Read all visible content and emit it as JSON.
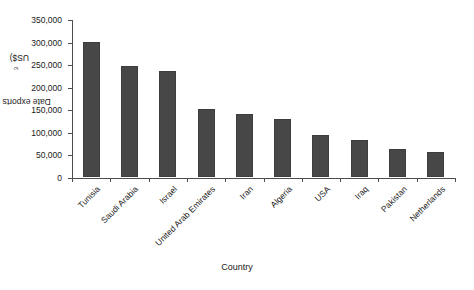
{
  "chart_data": {
    "type": "bar",
    "title": "",
    "xlabel": "Country",
    "ylabel": "Date exports (10³ US$)",
    "ylabel_prefix": "Date exports (10",
    "ylabel_exponent": "3",
    "ylabel_suffix": " US$)",
    "categories": [
      "Tunisia",
      "Saudi Arabia",
      "Israel",
      "United Arab Emirates",
      "Iran",
      "Algeria",
      "USA",
      "Iraq",
      "Pakistan",
      "Netherlands"
    ],
    "values": [
      298000,
      245000,
      235000,
      150000,
      140000,
      128000,
      92000,
      82000,
      62000,
      56000
    ],
    "ylim": [
      0,
      350000
    ],
    "ytick_labels": [
      "0",
      "50,000",
      "100,000",
      "150,000",
      "200,000",
      "250,000",
      "300,000",
      "350,000"
    ],
    "ytick_values": [
      0,
      50000,
      100000,
      150000,
      200000,
      250000,
      300000,
      350000
    ],
    "grid": false,
    "legend": false,
    "bar_color": "#474747",
    "axis_color": "#4d4d4d",
    "text_color": "#1a1a1a"
  }
}
